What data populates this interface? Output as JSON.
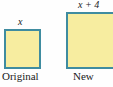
{
  "figure": {
    "background_color": "#fefefe",
    "shapes": [
      {
        "name": "original-square",
        "side_label": "x",
        "caption": "Original",
        "fill_color": "#f7eda0",
        "stroke_color": "#3f8ca0"
      },
      {
        "name": "new-square",
        "side_label": "x + 4",
        "caption": "New",
        "fill_color": "#f7eda0",
        "stroke_color": "#3f8ca0"
      }
    ],
    "labels": {
      "original_side": "x",
      "new_side": "x + 4",
      "original_caption": "Original",
      "new_caption": "New"
    }
  }
}
